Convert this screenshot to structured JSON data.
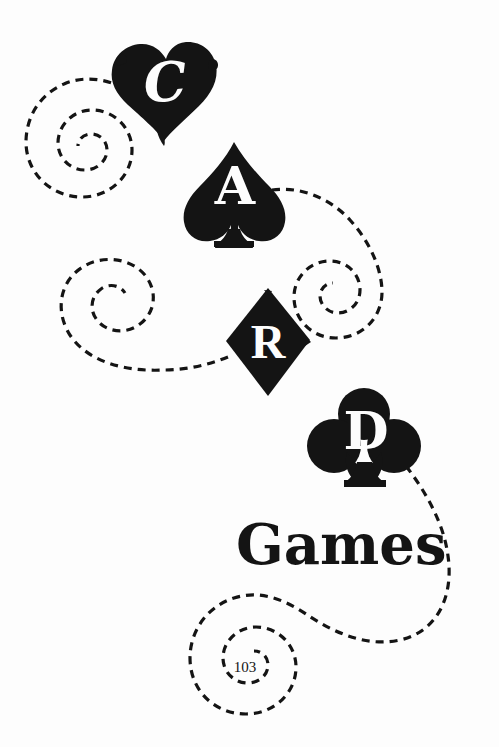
{
  "page": {
    "background_color": "#fdfdfd",
    "ink_color": "#141414",
    "paper_color": "#fdfdfd",
    "width": 499,
    "height": 747,
    "page_number": "103"
  },
  "suits": [
    {
      "name": "heart",
      "icon": "heart-icon",
      "letter": "C",
      "letter_color": "#fdfdfd",
      "fill_color": "#141414",
      "position": {
        "x": 112,
        "y": 42,
        "width": 104,
        "height": 100
      }
    },
    {
      "name": "spade",
      "icon": "spade-icon",
      "letter": "A",
      "letter_color": "#fdfdfd",
      "fill_color": "#141414",
      "position": {
        "x": 182,
        "y": 142,
        "width": 104,
        "height": 104
      }
    },
    {
      "name": "diamond",
      "icon": "diamond-icon",
      "letter": "R",
      "letter_color": "#fdfdfd",
      "fill_color": "#141414",
      "position": {
        "x": 225,
        "y": 288,
        "width": 86,
        "height": 108
      }
    },
    {
      "name": "club",
      "icon": "club-icon",
      "letter": "D",
      "letter_color": "#fdfdfd",
      "fill_color": "#141414",
      "position": {
        "x": 312,
        "y": 390,
        "width": 104,
        "height": 100
      }
    }
  ],
  "word": {
    "text": "Games"
  },
  "flourishes": {
    "stroke_color": "#141414",
    "stroke_width": 3,
    "dash_pattern": "8 6",
    "spirals": [
      {
        "name": "spiral-upper-left",
        "center_x": 88,
        "center_y": 155,
        "turns": 2.3
      },
      {
        "name": "spiral-right",
        "center_x": 347,
        "center_y": 288,
        "turns": 2.0
      },
      {
        "name": "spiral-middle-left",
        "center_x": 122,
        "center_y": 337,
        "turns": 2.4
      },
      {
        "name": "spiral-bottom",
        "center_x": 243,
        "center_y": 672,
        "turns": 2.6
      }
    ]
  },
  "footer": {
    "page_number": "103"
  }
}
